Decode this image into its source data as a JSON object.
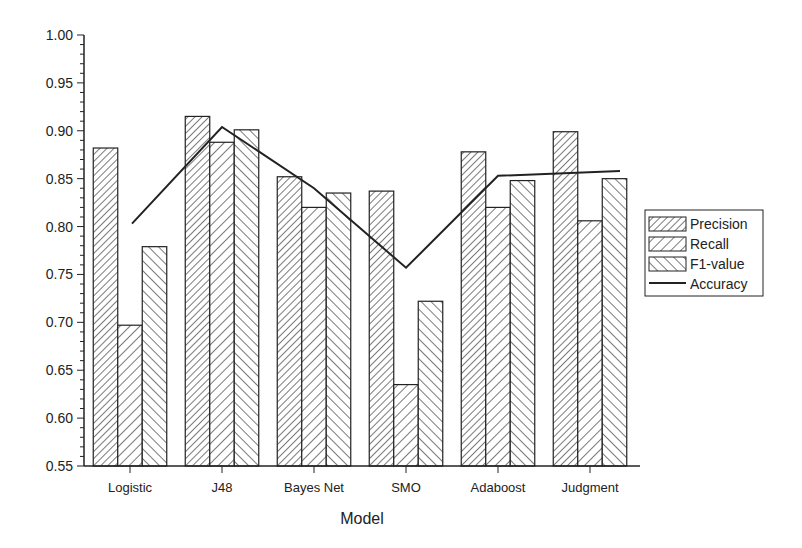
{
  "chart_data": {
    "type": "bar",
    "title": "",
    "xlabel": "Model",
    "ylabel": "",
    "ylim": [
      0.55,
      1.0
    ],
    "yticks": [
      "0.55",
      "0.60",
      "0.65",
      "0.70",
      "0.75",
      "0.80",
      "0.85",
      "0.90",
      "0.95",
      "1.00"
    ],
    "grid": false,
    "legend_position": "right",
    "categories": [
      "Logistic",
      "J48",
      "Bayes Net",
      "SMO",
      "Adaboost",
      "Judgment"
    ],
    "series": [
      {
        "name": "Precision",
        "kind": "bar",
        "pattern": "dense-forward-hatch",
        "values": [
          0.882,
          0.915,
          0.852,
          0.837,
          0.878,
          0.899
        ]
      },
      {
        "name": "Recall",
        "kind": "bar",
        "pattern": "forward-hatch",
        "values": [
          0.697,
          0.888,
          0.82,
          0.635,
          0.82,
          0.806
        ]
      },
      {
        "name": "F1-value",
        "kind": "bar",
        "pattern": "back-hatch",
        "values": [
          0.779,
          0.901,
          0.835,
          0.722,
          0.848,
          0.85
        ]
      },
      {
        "name": "Accuracy",
        "kind": "line",
        "values": [
          0.803,
          0.904,
          0.84,
          0.757,
          0.853,
          0.858
        ]
      }
    ]
  },
  "legend": {
    "items": [
      "Precision",
      "Recall",
      "F1-value",
      "Accuracy"
    ]
  },
  "colors": {
    "ink": "#222222",
    "background": "#ffffff"
  }
}
